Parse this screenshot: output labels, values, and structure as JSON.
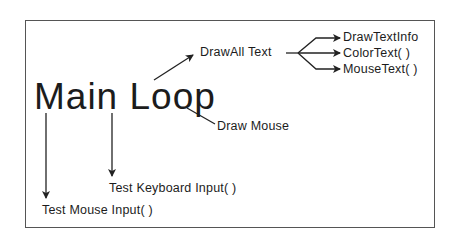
{
  "diagram": {
    "root": "Main Loop",
    "nodes": {
      "draw_all_text": "DrawAll Text",
      "draw_text_info": "DrawTextInfo",
      "color_text": "ColorText( )",
      "mouse_text": "MouseText( )",
      "draw_mouse": "Draw Mouse",
      "test_keyboard": "Test Keyboard Input( )",
      "test_mouse": "Test Mouse Input( )"
    },
    "edges": [
      {
        "from": "Main Loop",
        "to": "DrawAll Text"
      },
      {
        "from": "Main Loop",
        "to": "Draw Mouse"
      },
      {
        "from": "Main Loop",
        "to": "Test Keyboard Input( )"
      },
      {
        "from": "Main Loop",
        "to": "Test Mouse Input( )"
      },
      {
        "from": "DrawAll Text",
        "to": "DrawTextInfo"
      },
      {
        "from": "DrawAll Text",
        "to": "ColorText( )"
      },
      {
        "from": "DrawAll Text",
        "to": "MouseText( )"
      }
    ],
    "colors": {
      "line": "#222222",
      "border": "#555555",
      "background": "#ffffff"
    }
  }
}
